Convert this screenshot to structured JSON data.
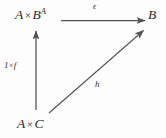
{
  "diagram": {
    "type": "commutative-diagram",
    "background_color": "#fdfdfd",
    "ink_color": "#55514e",
    "text_color": "#2b2b2b",
    "nodes": [
      {
        "id": "top-left",
        "label": "A × B^A",
        "base": "A",
        "operator": "×",
        "second": "B",
        "exponent": "A",
        "position": "top-left"
      },
      {
        "id": "top-right",
        "label": "B",
        "position": "top-right"
      },
      {
        "id": "bottom-left",
        "label": "A × C",
        "base": "A",
        "operator": "×",
        "second": "C",
        "position": "bottom-left"
      }
    ],
    "edges": [
      {
        "id": "epsilon-edge",
        "label": "ϵ",
        "from": "top-left",
        "to": "top-right",
        "direction": "horizontal-right"
      },
      {
        "id": "one-times-f-edge",
        "label": "1 × f",
        "first": "1",
        "operator": "×",
        "second": "f",
        "from": "bottom-left",
        "to": "top-left",
        "direction": "vertical-up"
      },
      {
        "id": "h-edge",
        "label": "h",
        "from": "bottom-left",
        "to": "top-right",
        "direction": "diagonal-up-right"
      }
    ]
  }
}
